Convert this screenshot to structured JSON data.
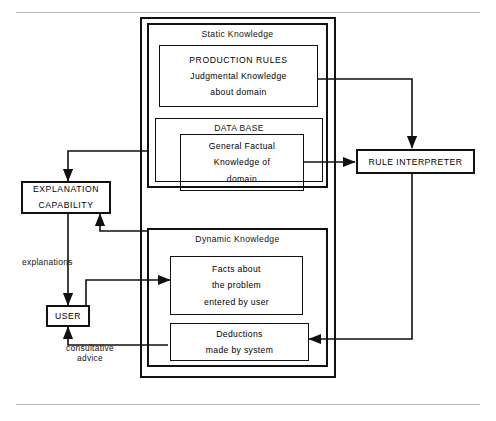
{
  "diagram": {
    "page_rules": {
      "top": "",
      "bottom": ""
    },
    "outer_container": {
      "name": "knowledge-base-container",
      "label": ""
    },
    "groups": [
      {
        "id": "static-knowledge",
        "title": "Static Knowledge",
        "children": [
          {
            "id": "production-rules",
            "lines": [
              "PRODUCTION RULES",
              "Judgmental Knowledge",
              "about domain"
            ]
          },
          {
            "id": "data-base",
            "title": "DATA BASE",
            "lines": [
              "General Factual",
              "Knowledge of",
              "domain"
            ]
          }
        ]
      },
      {
        "id": "dynamic-knowledge",
        "title": "Dynamic Knowledge",
        "children": [
          {
            "id": "facts",
            "lines": [
              "Facts about",
              "the problem",
              "entered by user"
            ]
          },
          {
            "id": "deductions",
            "lines": [
              "Deductions",
              "made by system"
            ]
          }
        ]
      }
    ],
    "nodes": [
      {
        "id": "explanation-capability",
        "lines": [
          "EXPLANATION",
          "CAPABILITY"
        ]
      },
      {
        "id": "user",
        "lines": [
          "USER"
        ]
      },
      {
        "id": "rule-interpreter",
        "lines": [
          "RULE INTERPRETER"
        ]
      }
    ],
    "edge_labels": [
      {
        "id": "explanations",
        "text": "explanations"
      },
      {
        "id": "consultative-advice",
        "line1": "consultative",
        "line2": "advice"
      }
    ],
    "colors": {
      "stroke": "#111111",
      "background": "#ffffff",
      "page_rule": "#b9b9b9"
    }
  }
}
